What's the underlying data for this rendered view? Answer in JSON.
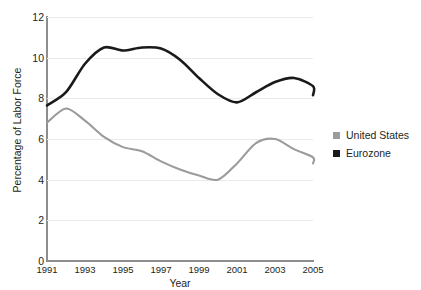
{
  "title_partial": "",
  "axes": {
    "xlabel": "Year",
    "ylabel": "Percentage of Labor Force",
    "yticks": [
      "12",
      "10",
      "8",
      "6",
      "4",
      "2",
      "0"
    ],
    "xticks": [
      "1991",
      "1993",
      "1995",
      "1997",
      "1999",
      "2001",
      "2003",
      "2005"
    ]
  },
  "legend": {
    "items": [
      {
        "label": "United States",
        "color": "#9b9b9b"
      },
      {
        "label": "Eurozone",
        "color": "#1a1a1a"
      }
    ]
  },
  "chart_data": {
    "type": "line",
    "title": "",
    "xlabel": "Year",
    "ylabel": "Percentage of Labor Force",
    "xlim": [
      1991,
      2005
    ],
    "ylim": [
      0,
      12
    ],
    "yticks": [
      0,
      2,
      4,
      6,
      8,
      10,
      12
    ],
    "xticks": [
      1991,
      1993,
      1995,
      1997,
      1999,
      2001,
      2003,
      2005
    ],
    "grid": "horizontal",
    "legend_position": "right",
    "x": [
      1991,
      1992,
      1993,
      1994,
      1995,
      1996,
      1997,
      1998,
      1999,
      2000,
      2001,
      2002,
      2003,
      2004,
      2005
    ],
    "series": [
      {
        "name": "United States",
        "color": "#9b9b9b",
        "values": [
          6.8,
          7.5,
          6.9,
          6.1,
          5.6,
          5.4,
          4.9,
          4.5,
          4.2,
          4.0,
          4.8,
          5.8,
          6.0,
          5.5,
          5.1
        ]
      },
      {
        "name": "Eurozone",
        "color": "#1a1a1a",
        "values": [
          7.65,
          8.3,
          9.7,
          10.5,
          10.35,
          10.5,
          10.45,
          9.9,
          9.0,
          8.2,
          7.8,
          8.3,
          8.8,
          9.0,
          8.6
        ]
      }
    ],
    "series_endpoints": {
      "United States": {
        "last_x": 2005,
        "last_value": 4.8
      },
      "Eurozone": {
        "last_x": 2005,
        "last_value": 8.15
      }
    }
  }
}
